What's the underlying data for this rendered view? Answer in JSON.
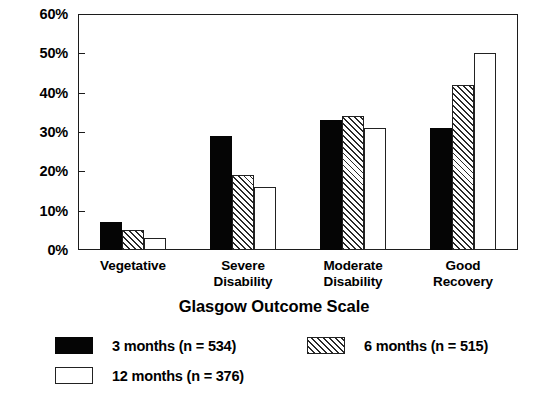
{
  "chart_data": {
    "type": "bar",
    "title": "",
    "xlabel": "Glasgow Outcome Scale",
    "ylabel": "",
    "ylim": [
      0,
      60
    ],
    "yticks": [
      0,
      10,
      20,
      30,
      40,
      50,
      60
    ],
    "ytick_labels": [
      "0%",
      "10%",
      "20%",
      "30%",
      "40%",
      "50%",
      "60%"
    ],
    "grid": false,
    "legend_position": "bottom-left",
    "categories": [
      "Vegetative",
      "Severe Disability",
      "Moderate Disability",
      "Good Recovery"
    ],
    "category_lines": [
      [
        "Vegetative"
      ],
      [
        "Severe",
        "Disability"
      ],
      [
        "Moderate",
        "Disability"
      ],
      [
        "Good",
        "Recovery"
      ]
    ],
    "series": [
      {
        "name": "3 months (n = 534)",
        "short_name": "3 months",
        "n": 534,
        "style": "solid",
        "color": "#050505",
        "values": [
          7,
          29,
          33,
          31
        ]
      },
      {
        "name": "6 months (n = 515)",
        "short_name": "6 months",
        "n": 515,
        "style": "hatch",
        "color": "#ffffff",
        "values": [
          5,
          19,
          34,
          42
        ]
      },
      {
        "name": "12 months (n = 376)",
        "short_name": "12 months",
        "n": 376,
        "style": "open",
        "color": "#ffffff",
        "values": [
          3,
          16,
          31,
          50
        ]
      }
    ]
  },
  "legend": {
    "items": [
      {
        "label": "3 months (n = 534)",
        "style": "solid"
      },
      {
        "label": "6 months (n = 515)",
        "style": "hatch"
      },
      {
        "label": "12 months (n = 376)",
        "style": "open"
      }
    ]
  },
  "colors": {
    "frame": "#1c1c1c",
    "text": "#000000",
    "background": "#ffffff",
    "series_solid": "#050505",
    "series_open": "#ffffff",
    "series_hatch_line": "#2a2a2a"
  }
}
